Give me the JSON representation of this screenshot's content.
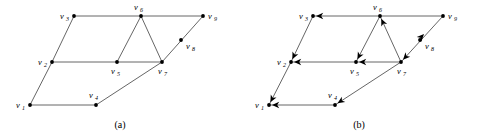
{
  "figure": {
    "title": "",
    "background_color": "#ffffff",
    "edge_color": "#555555",
    "node_color": "#000000",
    "width": 478,
    "height": 139,
    "panels": [
      {
        "id": "panel-a",
        "caption": "(a)",
        "caption_x": 120,
        "caption_y": 128,
        "directed": false,
        "nodes": [
          {
            "id": "v1",
            "label": "v",
            "sub": "1",
            "x": 30,
            "y": 105,
            "label_x": 16,
            "label_y": 108,
            "sub_x": 22,
            "sub_y": 110
          },
          {
            "id": "v2",
            "label": "v",
            "sub": "2",
            "x": 52,
            "y": 62,
            "label_x": 38,
            "label_y": 65,
            "sub_x": 44,
            "sub_y": 67
          },
          {
            "id": "v3",
            "label": "v",
            "sub": "3",
            "x": 74,
            "y": 16,
            "label_x": 60,
            "label_y": 19,
            "sub_x": 66,
            "sub_y": 21
          },
          {
            "id": "v4",
            "label": "v",
            "sub": "4",
            "x": 96,
            "y": 105,
            "label_x": 89,
            "label_y": 98,
            "sub_x": 95,
            "sub_y": 100
          },
          {
            "id": "v5",
            "label": "v",
            "sub": "5",
            "x": 117,
            "y": 62,
            "label_x": 111,
            "label_y": 74,
            "sub_x": 117,
            "sub_y": 76
          },
          {
            "id": "v6",
            "label": "v",
            "sub": "6",
            "x": 141,
            "y": 16,
            "label_x": 134,
            "label_y": 10,
            "sub_x": 140,
            "sub_y": 12
          },
          {
            "id": "v7",
            "label": "v",
            "sub": "7",
            "x": 162,
            "y": 62,
            "label_x": 158,
            "label_y": 74,
            "sub_x": 164,
            "sub_y": 76
          },
          {
            "id": "v8",
            "label": "v",
            "sub": "8",
            "x": 181,
            "y": 40,
            "label_x": 186,
            "label_y": 49,
            "sub_x": 192,
            "sub_y": 51
          },
          {
            "id": "v9",
            "label": "v",
            "sub": "9",
            "x": 203,
            "y": 16,
            "label_x": 208,
            "label_y": 19,
            "sub_x": 214,
            "sub_y": 21
          }
        ],
        "edges": [
          {
            "from": "v1",
            "to": "v2"
          },
          {
            "from": "v2",
            "to": "v3"
          },
          {
            "from": "v3",
            "to": "v6"
          },
          {
            "from": "v6",
            "to": "v9"
          },
          {
            "from": "v1",
            "to": "v4"
          },
          {
            "from": "v4",
            "to": "v7"
          },
          {
            "from": "v7",
            "to": "v9"
          },
          {
            "from": "v2",
            "to": "v5"
          },
          {
            "from": "v5",
            "to": "v7"
          },
          {
            "from": "v5",
            "to": "v6"
          },
          {
            "from": "v6",
            "to": "v7"
          }
        ]
      },
      {
        "id": "panel-b",
        "caption": "(b)",
        "caption_x": 359,
        "caption_y": 128,
        "directed": true,
        "nodes": [
          {
            "id": "v1",
            "label": "v",
            "sub": "1",
            "x": 269,
            "y": 105,
            "label_x": 255,
            "label_y": 108,
            "sub_x": 261,
            "sub_y": 110
          },
          {
            "id": "v2",
            "label": "v",
            "sub": "2",
            "x": 291,
            "y": 62,
            "label_x": 277,
            "label_y": 65,
            "sub_x": 283,
            "sub_y": 67
          },
          {
            "id": "v3",
            "label": "v",
            "sub": "3",
            "x": 313,
            "y": 16,
            "label_x": 299,
            "label_y": 19,
            "sub_x": 305,
            "sub_y": 21
          },
          {
            "id": "v4",
            "label": "v",
            "sub": "4",
            "x": 335,
            "y": 105,
            "label_x": 328,
            "label_y": 98,
            "sub_x": 334,
            "sub_y": 100
          },
          {
            "id": "v5",
            "label": "v",
            "sub": "5",
            "x": 356,
            "y": 62,
            "label_x": 350,
            "label_y": 74,
            "sub_x": 356,
            "sub_y": 76
          },
          {
            "id": "v6",
            "label": "v",
            "sub": "6",
            "x": 380,
            "y": 16,
            "label_x": 373,
            "label_y": 10,
            "sub_x": 379,
            "sub_y": 12
          },
          {
            "id": "v7",
            "label": "v",
            "sub": "7",
            "x": 401,
            "y": 62,
            "label_x": 397,
            "label_y": 74,
            "sub_x": 403,
            "sub_y": 76
          },
          {
            "id": "v8",
            "label": "v",
            "sub": "8",
            "x": 420,
            "y": 40,
            "label_x": 425,
            "label_y": 49,
            "sub_x": 431,
            "sub_y": 51
          },
          {
            "id": "v9",
            "label": "v",
            "sub": "9",
            "x": 443,
            "y": 16,
            "label_x": 448,
            "label_y": 19,
            "sub_x": 454,
            "sub_y": 21
          }
        ],
        "edges": [
          {
            "from": "v2",
            "to": "v1",
            "arrow": true
          },
          {
            "from": "v3",
            "to": "v2",
            "arrow": true
          },
          {
            "from": "v6",
            "to": "v3",
            "arrow": true
          },
          {
            "from": "v9",
            "to": "v6",
            "arrow": false
          },
          {
            "from": "v4",
            "to": "v1",
            "arrow": true
          },
          {
            "from": "v7",
            "to": "v4",
            "arrow": true
          },
          {
            "from": "v9",
            "to": "v7",
            "arrow": true
          },
          {
            "from": "v5",
            "to": "v2",
            "arrow": true
          },
          {
            "from": "v7",
            "to": "v5",
            "arrow": true
          },
          {
            "from": "v6",
            "to": "v5",
            "arrow": true
          },
          {
            "from": "v7",
            "to": "v6",
            "arrow": true
          }
        ],
        "extra_arrows": [
          {
            "name": "arrow-v8-toward-v9",
            "x": 424,
            "y": 34,
            "angle": -47
          }
        ]
      }
    ]
  }
}
